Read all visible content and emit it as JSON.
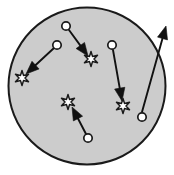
{
  "figure": {
    "title": "",
    "type": "vector-diagram",
    "canvas": {
      "width": 174,
      "height": 175,
      "background": "#ffffff"
    }
  },
  "colors": {
    "region_fill": "#cccccc",
    "region_stroke": "#1a1a1a",
    "node_fill": "#ffffff",
    "node_stroke": "#1a1a1a",
    "star_fill": "#ffffff",
    "star_stroke": "#1a1a1a",
    "arrow_color": "#111111"
  },
  "region": {
    "label": "enclosing-circle",
    "cx": 87,
    "cy": 86,
    "r": 78.5,
    "stroke_width": 2
  },
  "nodes": [
    {
      "id": "c1",
      "label": "",
      "cx": 66,
      "cy": 26,
      "r": 4.2
    },
    {
      "id": "c2",
      "label": "",
      "cx": 57,
      "cy": 45,
      "r": 4.2
    },
    {
      "id": "c3",
      "label": "",
      "cx": 112,
      "cy": 45,
      "r": 4.2
    },
    {
      "id": "c4",
      "label": "",
      "cx": 88,
      "cy": 138,
      "r": 4.2
    },
    {
      "id": "c5",
      "label": "",
      "cx": 142,
      "cy": 117,
      "r": 4.2
    }
  ],
  "stars": [
    {
      "id": "s1",
      "label": "",
      "cx": 91,
      "cy": 59,
      "r": 7.5,
      "rotation": 0
    },
    {
      "id": "s2",
      "label": "",
      "cx": 22,
      "cy": 78,
      "r": 7.5,
      "rotation": 0
    },
    {
      "id": "s3",
      "label": "",
      "cx": 68,
      "cy": 102,
      "r": 7.5,
      "rotation": 0
    },
    {
      "id": "s4",
      "label": "",
      "cx": 123,
      "cy": 106,
      "r": 7.5,
      "rotation": 0
    }
  ],
  "arrows": [
    {
      "id": "a1",
      "label": "",
      "from": "c1",
      "to": "s1",
      "x1": 69,
      "y1": 30,
      "x2": 88,
      "y2": 56,
      "exits_region": false
    },
    {
      "id": "a2",
      "label": "",
      "from": "c2",
      "to": "s2",
      "x1": 54,
      "y1": 48,
      "x2": 26,
      "y2": 74,
      "exits_region": false
    },
    {
      "id": "a3",
      "label": "",
      "from": "c3",
      "to": "s4",
      "x1": 113,
      "y1": 50,
      "x2": 122,
      "y2": 101,
      "exits_region": false
    },
    {
      "id": "a4",
      "label": "",
      "from": "c4",
      "to": "s3",
      "x1": 86,
      "y1": 134,
      "x2": 72,
      "y2": 107,
      "exits_region": false
    },
    {
      "id": "a5",
      "label": "",
      "from": "c5",
      "to": "outside",
      "x1": 142,
      "y1": 112,
      "x2": 166,
      "y2": 26,
      "exits_region": true
    }
  ]
}
